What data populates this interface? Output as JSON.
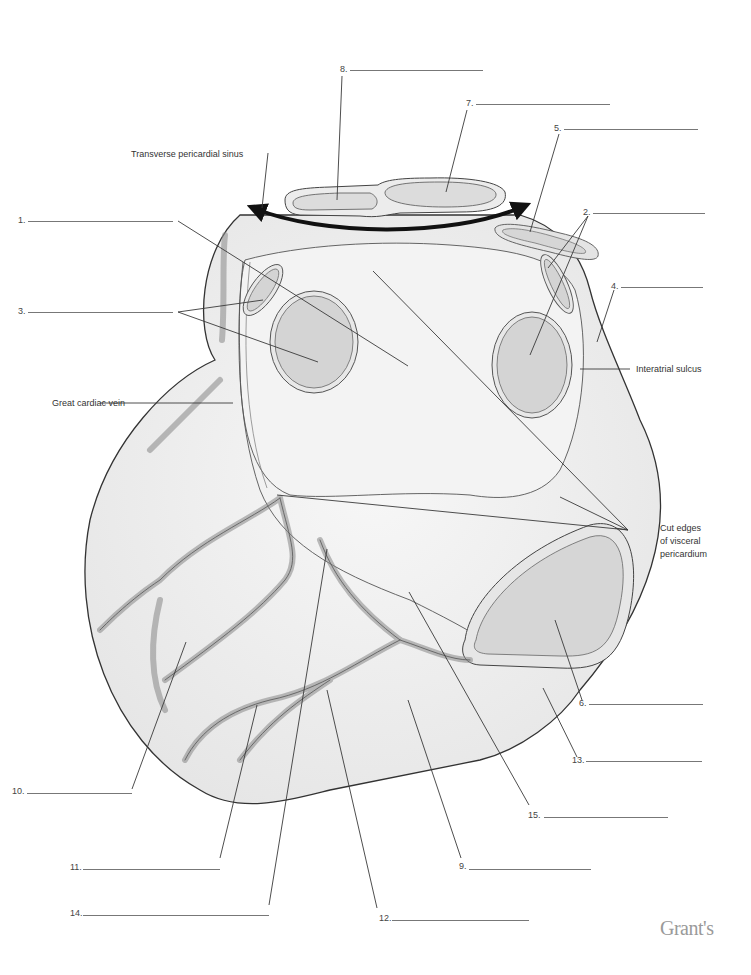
{
  "figure": {
    "brand": "Grant's"
  },
  "named_labels": [
    {
      "id": "transverse-sinus",
      "text": "Transverse pericardial sinus"
    },
    {
      "id": "great-cardiac-vein",
      "text": "Great cardiac vein"
    },
    {
      "id": "interatrial-sulcus",
      "text": "Interatrial sulcus"
    },
    {
      "id": "cut-edges-line1",
      "text": "Cut edges"
    },
    {
      "id": "cut-edges-line2",
      "text": "of visceral"
    },
    {
      "id": "cut-edges-line3",
      "text": "pericardium"
    }
  ],
  "blanks": [
    {
      "n": "1.",
      "x": 18,
      "y": 221,
      "len": 155
    },
    {
      "n": "2.",
      "x": 583,
      "y": 213,
      "len": 122
    },
    {
      "n": "3.",
      "x": 18,
      "y": 312,
      "len": 155
    },
    {
      "n": "4.",
      "x": 611,
      "y": 287,
      "len": 92
    },
    {
      "n": "5.",
      "x": 555,
      "y": 129,
      "len": 143
    },
    {
      "n": "6.",
      "x": 579,
      "y": 704,
      "len": 124
    },
    {
      "n": "7.",
      "x": 467,
      "y": 104,
      "len": 143
    },
    {
      "n": "8.",
      "x": 340,
      "y": 70,
      "len": 143
    },
    {
      "n": "9.",
      "x": 459,
      "y": 867,
      "len": 132
    },
    {
      "n": "10.",
      "x": 12,
      "y": 792,
      "len": 120
    },
    {
      "n": "11.",
      "x": 70,
      "y": 868,
      "len": 150
    },
    {
      "n": "12.",
      "x": 379,
      "y": 919,
      "len": 150
    },
    {
      "n": "13.",
      "x": 572,
      "y": 761,
      "len": 130
    },
    {
      "n": "14.",
      "x": 70,
      "y": 914,
      "len": 199
    },
    {
      "n": "15.",
      "x": 528,
      "y": 816,
      "len": 140
    }
  ],
  "colors": {
    "heart_fill": "#f0f0f0",
    "vessel_fill": "#d9d9d9",
    "outline": "#444444",
    "leader": "#3a3a3a",
    "arrow": "#111111"
  }
}
